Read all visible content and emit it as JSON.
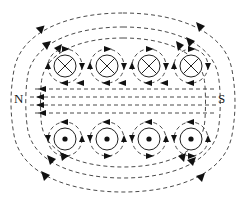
{
  "diagram": {
    "labels": {
      "north_pole": "N",
      "south_pole": "S"
    },
    "colors": {
      "line": "#4a4a4a",
      "coil_stroke": "#222222",
      "arrow_fill": "#111111",
      "background": "#ffffff",
      "label_color": "#1a1a1a"
    },
    "style": {
      "dash_pattern": "4,3",
      "line_width": 1.0,
      "coil_line_width": 1.0
    },
    "top_row": {
      "symbol": "cross-in-circle",
      "meaning": "current into page",
      "count": 4,
      "centers_x": [
        65,
        107,
        149,
        191
      ],
      "center_y": 66,
      "inner_radius": 11,
      "outer_radius": 17
    },
    "bottom_row": {
      "symbol": "dot-in-circle",
      "meaning": "current out of page",
      "count": 4,
      "centers_x": [
        65,
        107,
        149,
        191
      ],
      "center_y": 139,
      "inner_radius": 11,
      "outer_radius": 17,
      "dot_radius": 2.6
    },
    "interior_lines": {
      "count": 4,
      "direction": "leftward",
      "y_values": [
        89,
        97,
        105,
        113
      ],
      "x_start": 32,
      "x_end": 214
    },
    "outer_loops": {
      "count": 3,
      "description": "nested dashed closed field loops surrounding the coil"
    }
  }
}
